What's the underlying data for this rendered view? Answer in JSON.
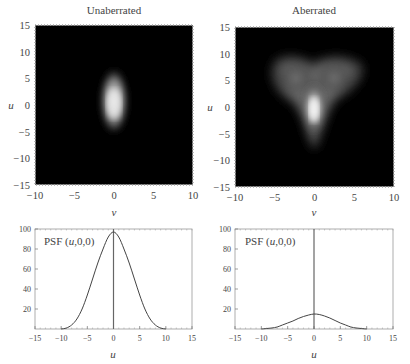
{
  "chart_data": [
    {
      "type": "heatmap",
      "title": "Unaberrated",
      "xlabel": "v",
      "ylabel": "u",
      "xlim": [
        -10,
        10
      ],
      "ylim": [
        -15,
        15
      ],
      "xticks": [
        "-10",
        "-5",
        "0",
        "5",
        "10"
      ],
      "yticks": [
        "15",
        "10",
        "5",
        "0",
        "-5",
        "-10",
        "-15"
      ],
      "description": "Single bright ellipse centered at (0,0), elongated along u, spanning u approx -5..6, v approx -2..2",
      "colormap": "grayscale"
    },
    {
      "type": "heatmap",
      "title": "Aberrated",
      "xlabel": "v",
      "ylabel": "u",
      "xlim": [
        -10,
        10
      ],
      "ylim": [
        -15,
        15
      ],
      "xticks": [
        "-10",
        "-5",
        "0",
        "5",
        "10"
      ],
      "yticks": [
        "15",
        "10",
        "5",
        "0",
        "-5",
        "-10",
        "-15"
      ],
      "description": "Heart/V-shaped diffuse spot: bright core near (0,0), lobes up to u~9 at v~-5 and v~5, tail down to u~-8",
      "colormap": "grayscale"
    },
    {
      "type": "line",
      "title": "",
      "annotation": "PSF (u,0,0)",
      "xlabel": "u",
      "ylabel": "",
      "xlim": [
        -15,
        15
      ],
      "ylim": [
        0,
        100
      ],
      "xticks": [
        "-15",
        "-10",
        "-5",
        "0",
        "5",
        "10",
        "15"
      ],
      "yticks": [
        "20",
        "40",
        "60",
        "80",
        "100"
      ],
      "series": [
        {
          "name": "PSF (u,0,0) unaberrated",
          "x": [
            -10,
            -9,
            -8,
            -7,
            -6,
            -5,
            -4,
            -3,
            -2,
            -1,
            0,
            1,
            2,
            3,
            4,
            5,
            6,
            7,
            8,
            9,
            10
          ],
          "values": [
            0,
            1,
            4,
            10,
            20,
            34,
            50,
            66,
            80,
            92,
            97,
            92,
            80,
            66,
            50,
            34,
            20,
            10,
            4,
            1,
            0
          ]
        }
      ],
      "vertical_line_x": 0
    },
    {
      "type": "line",
      "title": "",
      "annotation": "PSF (u,0,0)",
      "xlabel": "u",
      "ylabel": "",
      "xlim": [
        -15,
        15
      ],
      "ylim": [
        0,
        100
      ],
      "xticks": [
        "-15",
        "-10",
        "-5",
        "0",
        "5",
        "10",
        "15"
      ],
      "yticks": [
        "20",
        "40",
        "60",
        "80",
        "100"
      ],
      "series": [
        {
          "name": "PSF (u,0,0) aberrated",
          "x": [
            -10,
            -9,
            -8,
            -7,
            -6,
            -5,
            -4,
            -3,
            -2,
            -1,
            0,
            1,
            2,
            3,
            4,
            5,
            6,
            7,
            8,
            9,
            10
          ],
          "values": [
            0,
            0.5,
            1,
            2,
            4,
            6,
            8,
            10.5,
            12.5,
            14,
            15,
            14.5,
            13,
            11,
            8.5,
            6,
            4,
            2,
            1,
            0.5,
            0
          ]
        }
      ],
      "vertical_line_x": 0
    }
  ],
  "panels": {
    "top_left": {
      "title": "Unaberrated",
      "xlabel": "v",
      "ylabel": "u"
    },
    "top_right": {
      "title": "Aberrated",
      "xlabel": "v",
      "ylabel": "u"
    },
    "bottom_left": {
      "annotation": "PSF (u,0,0)",
      "xlabel": "u"
    },
    "bottom_right": {
      "annotation": "PSF (u,0,0)",
      "xlabel": "u"
    }
  }
}
